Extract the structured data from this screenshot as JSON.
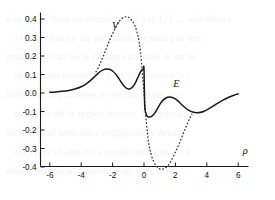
{
  "figure": {
    "background_color": "#ffffff",
    "ink_color": "#1a1a1a"
  },
  "ghost_text": {
    "note": "faint show-through text from reverse of scanned page",
    "lines": [
      "a la fin ou bien on remplace 1,2 par 1, 1 ... soit mieux",
      "avec les cas ou les potentiels ne sont pas tres",
      "grands. Le cas ou le champ est faible et ou le",
      "resultat est connu; on peut alors ecrire les",
      "formes asymptotiques et les raccorder aux",
      "solutions de la region interne. Les variations",
      "du potentiel sont alors negligeables devant",
      "celles du champ et la condition de raccord",
      "donne le resultat cherche pour les ondes"
    ]
  },
  "chart_data": {
    "type": "line",
    "title": "",
    "subtitle": "",
    "xlabel": "ρ",
    "ylabel": "",
    "xlim": [
      -7.0,
      7.0
    ],
    "ylim": [
      -0.47,
      0.47
    ],
    "grid": false,
    "legend_position": "inline-annotation",
    "xticks": [
      -6,
      -4,
      -2,
      0,
      2,
      4,
      6
    ],
    "xticklabels": [
      "-6",
      "-4",
      "-2",
      "0",
      "2",
      "4",
      "6"
    ],
    "yticks": [
      0.4,
      0.3,
      0.2,
      0.1,
      0.0,
      -0.1,
      -0.2,
      -0.3,
      -0.4
    ],
    "yticklabels": [
      "0.4",
      "0.3",
      "0.2",
      "0.1",
      "0.0",
      "-0.1",
      "-0.2",
      "-0.3",
      "-0.4"
    ],
    "annotations": [
      {
        "text": "V",
        "x": -1.85,
        "y": 0.345
      },
      {
        "text": "E",
        "x": 2.05,
        "y": 0.035
      },
      {
        "text": "ρ",
        "x": 6.45,
        "y": -0.33
      }
    ],
    "series": [
      {
        "name": "V",
        "style": "dotted",
        "color": "#3a3a3a",
        "x": [
          -3.05,
          -2.9,
          -2.75,
          -2.6,
          -2.45,
          -2.3,
          -2.15,
          -2.0,
          -1.85,
          -1.7,
          -1.55,
          -1.4,
          -1.25,
          -1.1,
          -1.0,
          -0.9,
          -0.75,
          -0.6,
          -0.45,
          -0.3,
          -0.15,
          0.0,
          0.15,
          0.3,
          0.45,
          0.6,
          0.75,
          0.9,
          1.0,
          1.1,
          1.25,
          1.4,
          1.55,
          1.7,
          1.85,
          2.0,
          2.15,
          2.3,
          2.45,
          2.6,
          2.75,
          2.9,
          3.05
        ],
        "y": [
          0.115,
          0.14,
          0.168,
          0.198,
          0.23,
          0.262,
          0.292,
          0.32,
          0.346,
          0.37,
          0.39,
          0.403,
          0.41,
          0.412,
          0.41,
          0.404,
          0.39,
          0.368,
          0.33,
          0.27,
          0.16,
          0.0,
          -0.16,
          -0.27,
          -0.33,
          -0.368,
          -0.39,
          -0.404,
          -0.41,
          -0.412,
          -0.41,
          -0.403,
          -0.39,
          -0.37,
          -0.346,
          -0.32,
          -0.292,
          -0.262,
          -0.23,
          -0.198,
          -0.168,
          -0.14,
          -0.115
        ]
      },
      {
        "name": "E",
        "style": "solid",
        "color": "#1a1a1a",
        "x": [
          -6.0,
          -5.6,
          -5.2,
          -4.8,
          -4.4,
          -4.0,
          -3.7,
          -3.4,
          -3.1,
          -2.85,
          -2.6,
          -2.4,
          -2.2,
          -2.0,
          -1.8,
          -1.6,
          -1.45,
          -1.3,
          -1.15,
          -1.0,
          -0.85,
          -0.7,
          -0.55,
          -0.4,
          -0.28,
          -0.18,
          -0.1,
          -0.04,
          0.0,
          0.04,
          0.1,
          0.18,
          0.3,
          0.45,
          0.6,
          0.75,
          0.9,
          1.05,
          1.2,
          1.4,
          1.6,
          1.8,
          2.0,
          2.25,
          2.5,
          2.8,
          3.1,
          3.4,
          3.8,
          4.2,
          4.6,
          5.0,
          5.4,
          5.8,
          6.0
        ],
        "y": [
          0.004,
          0.006,
          0.009,
          0.014,
          0.022,
          0.034,
          0.048,
          0.068,
          0.092,
          0.112,
          0.125,
          0.13,
          0.128,
          0.119,
          0.102,
          0.078,
          0.058,
          0.04,
          0.028,
          0.022,
          0.024,
          0.035,
          0.055,
          0.082,
          0.105,
          0.12,
          0.128,
          0.131,
          0.132,
          -0.06,
          -0.105,
          -0.122,
          -0.13,
          -0.128,
          -0.118,
          -0.1,
          -0.078,
          -0.056,
          -0.04,
          -0.027,
          -0.022,
          -0.024,
          -0.032,
          -0.05,
          -0.07,
          -0.091,
          -0.103,
          -0.107,
          -0.1,
          -0.082,
          -0.06,
          -0.04,
          -0.023,
          -0.01,
          -0.005
        ]
      }
    ]
  }
}
